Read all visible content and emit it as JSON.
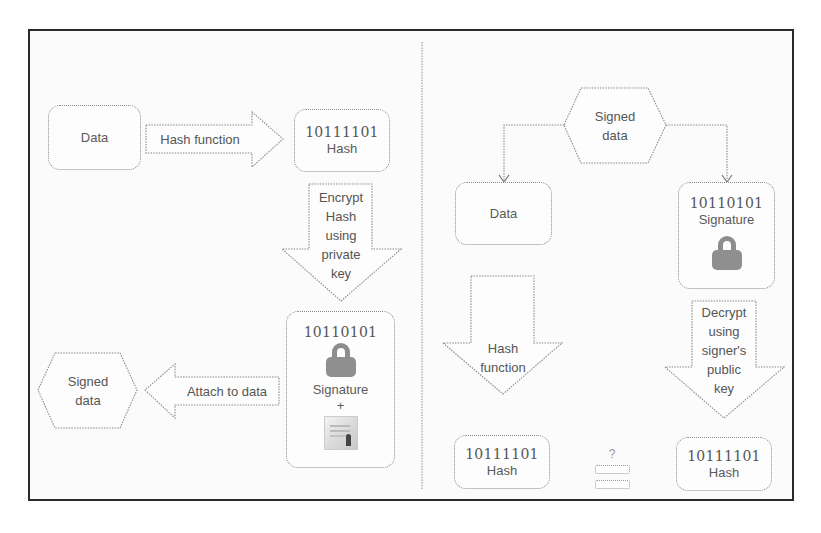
{
  "diagram": {
    "colors": {
      "frame": "#2a2a2a",
      "stroke": "#8a8a8a",
      "lock": "#8f8f8f",
      "text": "#555555"
    },
    "signing": {
      "data_box": {
        "label": "Data"
      },
      "hash_arrow": {
        "label": "Hash function"
      },
      "hash_box": {
        "value": "10111101",
        "label": "Hash"
      },
      "encrypt_arrow": {
        "lines": [
          "Encrypt",
          "Hash",
          "using",
          "private",
          "key"
        ]
      },
      "signature_box": {
        "value": "10110101",
        "icon": "lock-icon",
        "label": "Signature",
        "plus": "+",
        "attachment_icon": "certificate-icon"
      },
      "attach_arrow": {
        "label": "Attach to data"
      },
      "signed_data": {
        "lines": [
          "Signed",
          "data"
        ]
      }
    },
    "verification": {
      "signed_data": {
        "lines": [
          "Signed",
          "data"
        ]
      },
      "data_box": {
        "label": "Data"
      },
      "signature_box": {
        "value": "10110101",
        "label": "Signature",
        "icon": "lock-icon"
      },
      "hash_arrow": {
        "lines": [
          "Hash",
          "function"
        ]
      },
      "decrypt_arrow": {
        "lines": [
          "Decrypt",
          "using",
          "signer's",
          "public",
          "key"
        ]
      },
      "left_hash_box": {
        "value": "10111101",
        "label": "Hash"
      },
      "right_hash_box": {
        "value": "10111101",
        "label": "Hash"
      },
      "comparison": {
        "question": "?",
        "symbol": "equals"
      }
    }
  }
}
